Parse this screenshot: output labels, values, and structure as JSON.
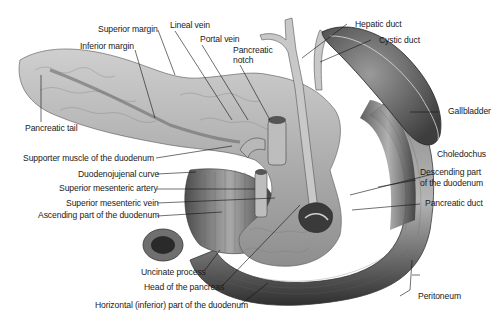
{
  "diagram": {
    "colors": {
      "organ_light": "#c9c9c9",
      "organ_mid": "#9a9a9a",
      "organ_dark": "#4a4a4a",
      "line": "#1a1a1a",
      "background": "#ffffff"
    },
    "labels": {
      "superior_margin": "Superior margin",
      "lineal_vein": "Lineal vein",
      "portal_vein": "Portal vein",
      "pancreatic_notch_1": "Pancreatic",
      "pancreatic_notch_2": "notch",
      "hepatic_duct": "Hepatic duct",
      "cystic_duct": "Cystic duct",
      "inferior_margin": "Inferior margin",
      "gallbladder": "Gallbladder",
      "pancreatic_tail": "Pancreatic tail",
      "supporter_muscle": "Supporter muscle of the duodenum",
      "choledochus": "Choledochus",
      "duodenojujenal_curve": "Duodenojujenal curve",
      "descending_part_1": "Descending part",
      "descending_part_2": "of the duodenum",
      "superior_mesenteric_artery": "Superior mesenteric artery",
      "superior_mesenteric_vein": "Superior mesenteric vein",
      "pancreatic_duct": "Pancreatic duct",
      "ascending_part": "Ascending part of the duodenum",
      "uncinate_process": "Uncinate process",
      "head_of_pancreas": "Head of the pancreas",
      "peritoneum": "Peritoneum",
      "horizontal_part": "Horizontal (inferior) part of the duodenum"
    }
  }
}
